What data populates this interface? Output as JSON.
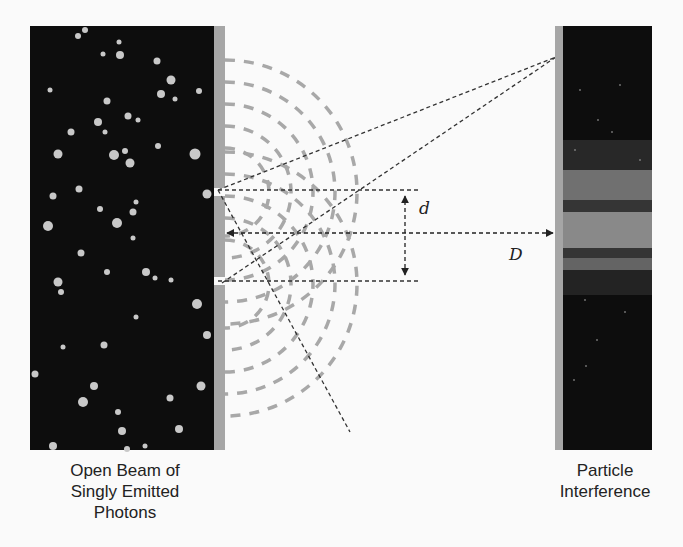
{
  "diagram": {
    "left_panel": {
      "caption_lines": [
        "Open Beam of",
        "Singly Emitted",
        "Photons"
      ],
      "background": "#0d0d0d",
      "dot_color": "#c8c8c8"
    },
    "barrier": {
      "color": "#a6a6a6"
    },
    "right_panel": {
      "caption_lines": [
        "Particle",
        "Interference"
      ],
      "background": "#0d0d0d"
    },
    "labels": {
      "slit_separation": "d",
      "screen_distance": "D"
    },
    "colors": {
      "wavefront": "#a8a8a8",
      "ray": "#333333",
      "background": "#fafafa"
    }
  }
}
